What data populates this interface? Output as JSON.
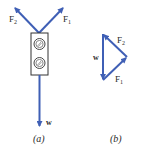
{
  "colors": {
    "arrow": "#3f5fb5",
    "outline": "#333333",
    "text": "#2a2a2a",
    "background": "#ffffff"
  },
  "panel_a": {
    "caption": "(a)",
    "object": "traffic-light",
    "vectors": [
      {
        "name": "F1",
        "label_main": "F",
        "label_sub": "1",
        "direction": "up-right"
      },
      {
        "name": "F2",
        "label_main": "F",
        "label_sub": "2",
        "direction": "up-left"
      },
      {
        "name": "w",
        "label_main": "w",
        "direction": "down"
      }
    ]
  },
  "panel_b": {
    "caption": "(b)",
    "description": "Closed force triangle (vector sum = 0)",
    "vectors": [
      {
        "name": "w",
        "label_main": "w",
        "from": "top",
        "to": "bottom-left"
      },
      {
        "name": "F1",
        "label_main": "F",
        "label_sub": "1",
        "from": "bottom-left",
        "to": "right"
      },
      {
        "name": "F2",
        "label_main": "F",
        "label_sub": "2",
        "from": "right",
        "to": "top"
      }
    ]
  }
}
